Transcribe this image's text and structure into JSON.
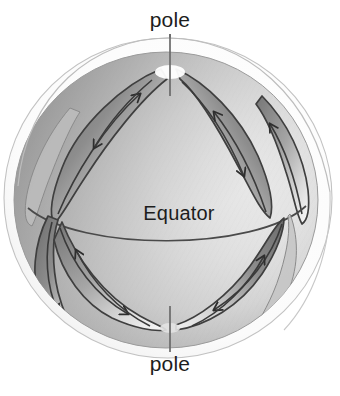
{
  "figure": {
    "title_visible": false,
    "background_color": "#ffffff",
    "ink_color": "#1d1d1d",
    "style": "grayscale-shaded-illustration"
  },
  "labels": {
    "pole_top": "pole",
    "pole_bottom": "pole",
    "equator": "Equator"
  },
  "colors": {
    "sphere_highlight": "#fdfdfd",
    "sphere_midtone": "#d8d8d8",
    "sphere_shadow": "#9a9a9a",
    "sphere_rim_dark": "#8e8e8e",
    "cell_dark": "#6f6f6f",
    "cell_light": "#e9e9e9",
    "outline": "#3a3a3a",
    "outer_shell_line": "#b9b9b9",
    "leader_line": "#6a6a6a",
    "arrow": "#2e2e2e"
  },
  "geometry": {
    "sphere_center_x": 166,
    "sphere_center_y": 200,
    "sphere_radius_x": 152,
    "sphere_radius_y": 148,
    "outer_shell_radius_x": 164,
    "outer_shell_radius_y": 160,
    "equator_arc_sag": 26,
    "pole_axis_x": 170
  },
  "elements": {
    "sphere": "shaded-sphere",
    "outer_shell": "thin-outer-arc",
    "equator_line": "curved-equator-arc",
    "pole_axis_top": "leader-line-to-north-pole",
    "pole_axis_bottom": "leader-line-to-south-pole",
    "northern_cells": 3,
    "southern_cells": 3,
    "arrows_total": 12
  },
  "cells": {
    "northern": [
      {
        "name": "north-cell-left",
        "flow": "poleward-then-equatorward",
        "arrow_count": 2
      },
      {
        "name": "north-cell-center",
        "flow": "poleward-then-equatorward",
        "arrow_count": 2
      },
      {
        "name": "north-cell-right",
        "flow": "poleward-then-equatorward",
        "arrow_count": 2
      }
    ],
    "southern": [
      {
        "name": "south-cell-left",
        "flow": "equatorward-then-poleward",
        "arrow_count": 2
      },
      {
        "name": "south-cell-center",
        "flow": "equatorward-then-poleward",
        "arrow_count": 2
      },
      {
        "name": "south-cell-right",
        "flow": "equatorward-then-poleward",
        "arrow_count": 2
      }
    ]
  }
}
